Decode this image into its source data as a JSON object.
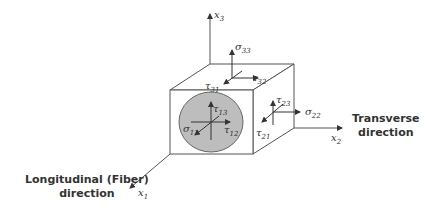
{
  "diagram": {
    "axes": {
      "x1": {
        "symbol": "x",
        "sub": "1"
      },
      "x2": {
        "symbol": "x",
        "sub": "2"
      },
      "x3": {
        "symbol": "x",
        "sub": "3"
      }
    },
    "stresses": {
      "s33": {
        "symbol": "σ",
        "sub": "33"
      },
      "t32": {
        "symbol": "τ",
        "sub": "32"
      },
      "t31": {
        "symbol": "τ",
        "sub": "31"
      },
      "t13": {
        "symbol": "τ",
        "sub": "13"
      },
      "t12": {
        "symbol": "τ",
        "sub": "12"
      },
      "s11": {
        "symbol": "σ",
        "sub": "11"
      },
      "t23": {
        "symbol": "τ",
        "sub": "23"
      },
      "t21": {
        "symbol": "τ",
        "sub": "21"
      },
      "s22": {
        "symbol": "σ",
        "sub": "22"
      }
    },
    "captions": {
      "transverse_line1": "Transverse",
      "transverse_line2": "direction",
      "longitudinal_line1": "Longitudinal (Fiber)",
      "longitudinal_line2": "direction"
    },
    "colors": {
      "line": "#444444",
      "fiber_fill": "#bdbdbd",
      "face": "#ffffff"
    }
  }
}
